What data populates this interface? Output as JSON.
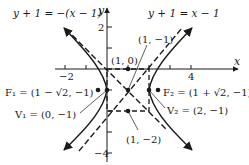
{
  "diagram": {
    "type": "hyperbola-graph",
    "axes": {
      "x_label": "x",
      "y_label": "y",
      "x_ticks": [
        {
          "value": -2,
          "label": "−2"
        },
        {
          "value": 4,
          "label": "4"
        }
      ],
      "y_ticks": [
        {
          "value": 2,
          "label": "2"
        },
        {
          "value": -4,
          "label": "−4"
        }
      ]
    },
    "asymptotes": [
      {
        "label": "y + 1 = −(x − 1)"
      },
      {
        "label": "y + 1 = x − 1"
      }
    ],
    "points": {
      "top_mid": "(1, 0)",
      "center": "(1, −1)",
      "bottom_mid": "(1, −2)",
      "f1": "F₁ = (1 − √2, −1)",
      "f2": "F₂ = (1 + √2, −1)",
      "v1": "V₁ = (0, −1)",
      "v2": "V₂ = (2, −1)"
    },
    "colors": {
      "ink": "#1a1a1a"
    }
  }
}
